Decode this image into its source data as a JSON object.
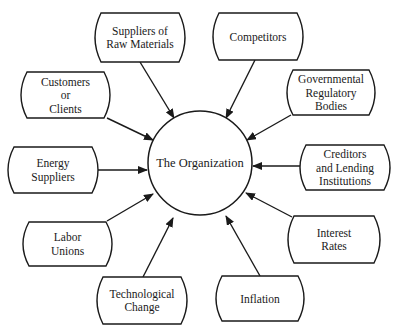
{
  "center": {
    "label": "The Organization",
    "cx": 200,
    "cy": 163,
    "r": 52
  },
  "nodes": [
    {
      "id": "suppliers-raw-materials",
      "lines": [
        "Suppliers of",
        "Raw Materials"
      ],
      "x": 95,
      "y": 13,
      "w": 90,
      "h": 49,
      "from": [
        140,
        62
      ],
      "to": [
        174,
        118
      ]
    },
    {
      "id": "competitors",
      "lines": [
        "Competitors"
      ],
      "x": 213,
      "y": 13,
      "w": 90,
      "h": 47,
      "from": [
        255,
        60
      ],
      "to": [
        226,
        118
      ]
    },
    {
      "id": "customers-clients",
      "lines": [
        "Customers",
        "or",
        "Clients"
      ],
      "x": 21,
      "y": 72,
      "w": 89,
      "h": 46,
      "from": [
        107,
        118
      ],
      "to": [
        153,
        140
      ]
    },
    {
      "id": "governmental-regulatory-bodies",
      "lines": [
        "Governmental",
        "Regulatory",
        "Bodies"
      ],
      "x": 287,
      "y": 70,
      "w": 88,
      "h": 45,
      "from": [
        291,
        115
      ],
      "to": [
        247,
        140
      ]
    },
    {
      "id": "energy-suppliers",
      "lines": [
        "Energy",
        "Suppliers"
      ],
      "x": 8,
      "y": 147,
      "w": 90,
      "h": 46,
      "from": [
        98,
        170
      ],
      "to": [
        147,
        170
      ]
    },
    {
      "id": "creditors-lending-institutions",
      "lines": [
        "Creditors",
        "and Lending",
        "Institutions"
      ],
      "x": 300,
      "y": 145,
      "w": 90,
      "h": 45,
      "from": [
        300,
        166
      ],
      "to": [
        253,
        166
      ]
    },
    {
      "id": "labor-unions",
      "lines": [
        "Labor",
        "Unions"
      ],
      "x": 23,
      "y": 222,
      "w": 89,
      "h": 44,
      "from": [
        107,
        221
      ],
      "to": [
        153,
        194
      ]
    },
    {
      "id": "interest-rates",
      "lines": [
        "Interest",
        "Rates"
      ],
      "x": 288,
      "y": 216,
      "w": 92,
      "h": 47,
      "from": [
        292,
        217
      ],
      "to": [
        246,
        193
      ]
    },
    {
      "id": "technological-change",
      "lines": [
        "Technological",
        "Change"
      ],
      "x": 97,
      "y": 277,
      "w": 90,
      "h": 47,
      "from": [
        143,
        277
      ],
      "to": [
        173,
        218
      ]
    },
    {
      "id": "inflation",
      "lines": [
        "Inflation"
      ],
      "x": 216,
      "y": 276,
      "w": 88,
      "h": 45,
      "from": [
        260,
        276
      ],
      "to": [
        226,
        216
      ]
    }
  ],
  "colors": {
    "stroke": "#1a1a1a",
    "background": "#ffffff",
    "text": "#1a1a1a"
  }
}
